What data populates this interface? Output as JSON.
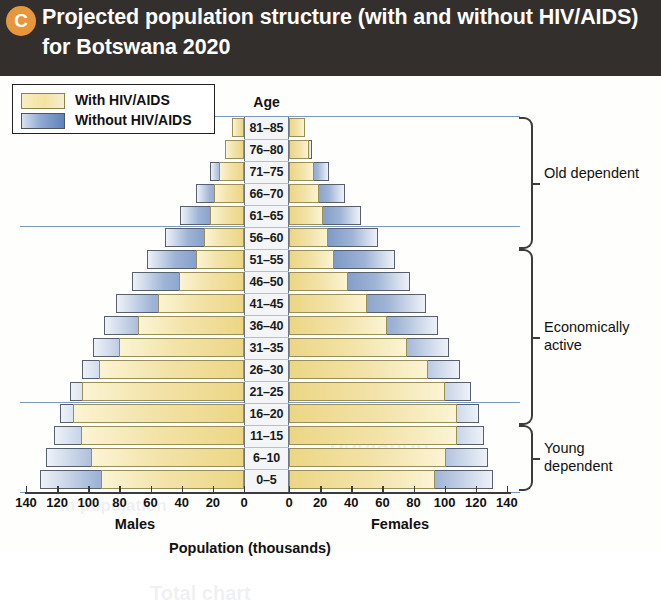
{
  "figure": {
    "badge": "C",
    "title": "Projected population structure (with and without HIV/AIDS) for Botswana 2020"
  },
  "legend": {
    "items": [
      {
        "label": "With HIV/AIDS",
        "color": "#f2e3a4",
        "swatch": "yellow"
      },
      {
        "label": "Without HIV/AIDS",
        "color": "#5f82ba",
        "swatch": "blue"
      }
    ]
  },
  "axis": {
    "age_heading": "Age",
    "left_sex_label": "Males",
    "right_sex_label": "Females",
    "x_axis_title": "Population (thousands)",
    "tick_labels_left": [
      "140",
      "120",
      "100",
      "80",
      "60",
      "40",
      "20",
      "0"
    ],
    "tick_labels_right": [
      "0",
      "20",
      "40",
      "60",
      "80",
      "100",
      "120",
      "140"
    ],
    "xlim": [
      0,
      140
    ]
  },
  "brackets": [
    {
      "label": "Old dependent",
      "from_age": "56–60",
      "to_age": "81–85"
    },
    {
      "label": "Economically active",
      "from_age": "16–20",
      "to_age": "51–55"
    },
    {
      "label": "Young dependent",
      "from_age": "0–5",
      "to_age": "11–15"
    }
  ],
  "ghost_text": [
    {
      "text": "Total chart",
      "x": 150,
      "y": 506,
      "size": 20
    },
    {
      "text": "opulation",
      "x": 330,
      "y": 356,
      "size": 22
    },
    {
      "text": "In population",
      "x": 60,
      "y": 420,
      "size": 17
    }
  ],
  "chart_data": {
    "type": "bar",
    "subtype": "population-pyramid",
    "title": "Projected population structure (with and without HIV/AIDS) for Botswana 2020",
    "xlabel": "Population (thousands)",
    "ylabel": "Age",
    "xlim": [
      0,
      140
    ],
    "grid": false,
    "legend_position": "top-left",
    "units": "thousands",
    "categories": [
      "81–85",
      "76–80",
      "71–75",
      "66–70",
      "61–65",
      "56–60",
      "51–55",
      "46–50",
      "41–45",
      "36–40",
      "31–35",
      "26–30",
      "21–25",
      "16–20",
      "11–15",
      "6–10",
      "0–5"
    ],
    "series": [
      {
        "name": "Males – Without HIV/AIDS",
        "side": "left",
        "color": "#5f82ba",
        "values": [
          5,
          11,
          22,
          31,
          41,
          51,
          62,
          72,
          82,
          90,
          97,
          104,
          112,
          118,
          122,
          127,
          131
        ]
      },
      {
        "name": "Males – With HIV/AIDS",
        "side": "left",
        "color": "#f2e3a4",
        "values": [
          8,
          12,
          16,
          19,
          22,
          26,
          31,
          42,
          55,
          68,
          80,
          93,
          104,
          110,
          105,
          98,
          92
        ]
      },
      {
        "name": "Females – Without HIV/AIDS",
        "side": "right",
        "color": "#5f82ba",
        "values": [
          8,
          15,
          26,
          36,
          46,
          57,
          68,
          78,
          88,
          96,
          103,
          110,
          117,
          122,
          125,
          128,
          131
        ]
      },
      {
        "name": "Females – With HIV/AIDS",
        "side": "right",
        "color": "#f2e3a4",
        "values": [
          10,
          13,
          16,
          19,
          22,
          25,
          29,
          38,
          50,
          63,
          76,
          89,
          100,
          108,
          108,
          101,
          94
        ]
      }
    ]
  }
}
